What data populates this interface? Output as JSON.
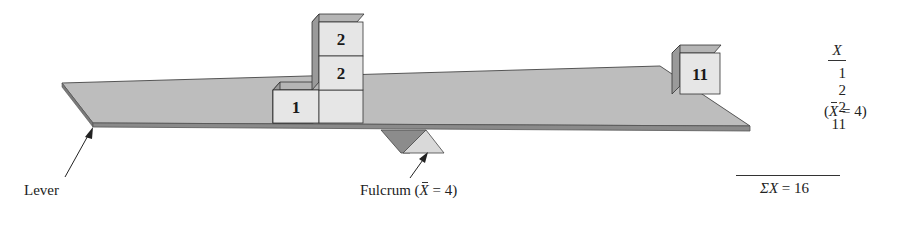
{
  "diagram": {
    "labels": {
      "lever": "Lever",
      "fulcrum_prefix": "Fulcrum (",
      "fulcrum_mean_symbol": "X",
      "fulcrum_suffix": " = 4)"
    },
    "boxes": [
      {
        "value": "1",
        "position": "bottom-left"
      },
      {
        "value": "2",
        "position": "bottom-right"
      },
      {
        "value": "2",
        "position": "stacked-top"
      },
      {
        "value": "11",
        "position": "far-right"
      }
    ],
    "colors": {
      "plank": "#bdbdbd",
      "plank_edge": "#6e6e6e",
      "box_face": "#e6e6e6",
      "box_side": "#9a9a9a",
      "box_top": "#b5b5b5",
      "fulcrum_front": "#d9d9d9",
      "fulcrum_back": "#8c8c8c",
      "ink": "#222222"
    }
  },
  "table": {
    "header": "X",
    "values": [
      "1",
      "2",
      "2",
      "11"
    ],
    "mean_note_prefix": "(",
    "mean_symbol": "X",
    "mean_note_suffix": " = 4)",
    "sum_symbol": "ΣX",
    "sum_text": " = 16"
  }
}
